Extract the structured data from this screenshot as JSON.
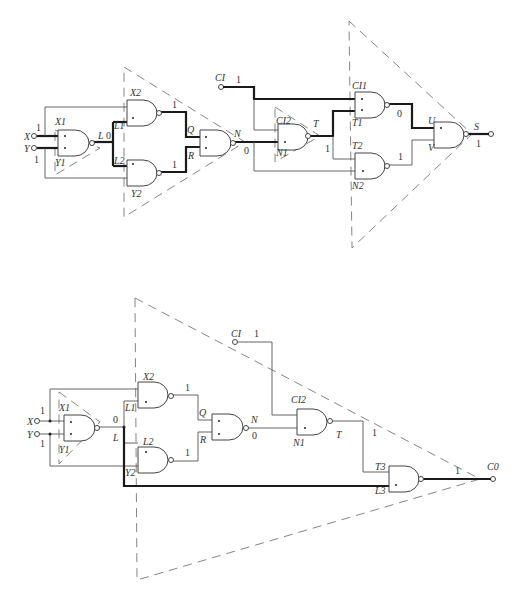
{
  "diagram": {
    "type": "logic-circuit",
    "top_circuit": {
      "output": "S",
      "inputs": {
        "X": {
          "label": "X",
          "value": "1"
        },
        "Y": {
          "label": "Y",
          "value": "1"
        },
        "CI": {
          "label": "CI",
          "value": "1"
        }
      },
      "labels": {
        "X1": "X1",
        "Y1": "Y1",
        "L": "L",
        "L_val": "0",
        "X2": "X2",
        "L1": "L1",
        "L2": "L2",
        "Y2": "Y2",
        "Q": "Q",
        "Q_val": "1",
        "R": "R",
        "R_val": "1",
        "N": "N",
        "N_val": "0",
        "CI2": "CI2",
        "N1": "N1",
        "T": "T",
        "T_val": "1",
        "CI1": "CI1",
        "T1": "T1",
        "T2": "T2",
        "N2": "N2",
        "U": "U",
        "U_val": "0",
        "V": "V",
        "V_val": "1",
        "S": "S",
        "S_val": "1"
      }
    },
    "bottom_circuit": {
      "output": "CO",
      "inputs": {
        "X": {
          "label": "X",
          "value": "1"
        },
        "Y": {
          "label": "Y",
          "value": "1"
        },
        "CI": {
          "label": "CI",
          "value": "1"
        }
      },
      "labels": {
        "X1": "X1",
        "Y1": "Y1",
        "L": "L",
        "L_val": "0",
        "X2": "X2",
        "L1": "L1",
        "L2": "L2",
        "Y2": "Y2",
        "Q": "Q",
        "Q_val": "1",
        "R": "R",
        "R_val": "1",
        "N": "N",
        "N_val": "0",
        "CI2": "CI2",
        "N1": "N1",
        "T": "T",
        "T_val": "1",
        "T3": "T3",
        "L3": "L3",
        "CO": "C0",
        "CO_val": "1"
      }
    }
  }
}
